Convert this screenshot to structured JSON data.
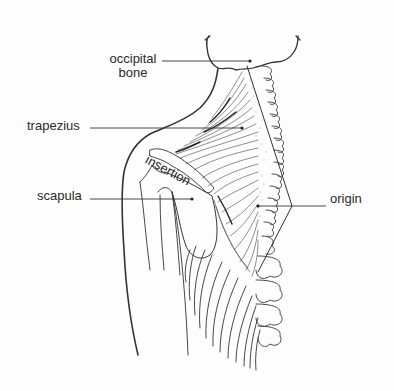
{
  "diagram": {
    "labels": {
      "occipital_line1": "occipital",
      "occipital_line2": "bone",
      "trapezius": "trapezius",
      "scapula": "scapula",
      "origin": "origin",
      "insertion": "insertion"
    },
    "colors": {
      "ink": "#2a2a2a",
      "background": "#fdfdfd"
    }
  }
}
